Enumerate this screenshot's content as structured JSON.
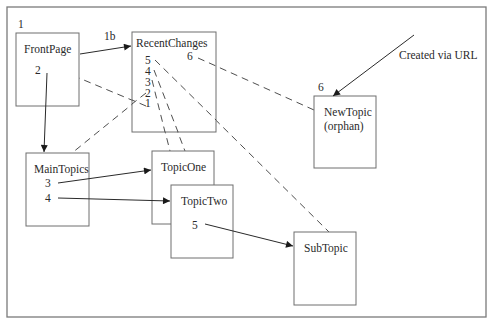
{
  "diagram": {
    "type": "wiki-link-graph",
    "nodes": [
      {
        "id": "frontpage",
        "label": "FrontPage",
        "step": "1",
        "links": [
          "2"
        ]
      },
      {
        "id": "recentchanges",
        "label": "RecentChanges",
        "step": "1b",
        "links": [
          "5",
          "4",
          "3",
          "2",
          "1",
          "6"
        ]
      },
      {
        "id": "newtopic",
        "label": "NewTopic",
        "sublabel": "(orphan)",
        "step": "6"
      },
      {
        "id": "maintopics",
        "label": "MainTopics",
        "links": [
          "3",
          "4"
        ]
      },
      {
        "id": "topicone",
        "label": "TopicOne"
      },
      {
        "id": "topictwo",
        "label": "TopicTwo",
        "links": [
          "5"
        ]
      },
      {
        "id": "subtopic",
        "label": "SubTopic"
      }
    ],
    "edges": [
      {
        "from": "frontpage",
        "to": "recentchanges",
        "label": "1b",
        "style": "solid-arrow"
      },
      {
        "from": "frontpage",
        "to": "maintopics",
        "label": "2",
        "style": "solid-arrow"
      },
      {
        "from": "maintopics",
        "to": "topicone",
        "label": "3",
        "style": "solid-arrow"
      },
      {
        "from": "maintopics",
        "to": "topictwo",
        "label": "4",
        "style": "solid-arrow"
      },
      {
        "from": "topictwo",
        "to": "subtopic",
        "label": "5",
        "style": "solid-arrow"
      },
      {
        "from": "external",
        "to": "newtopic",
        "label": "Created via URL",
        "style": "solid-arrow"
      },
      {
        "from": "recentchanges",
        "to": "frontpage",
        "label": "1",
        "style": "dashed"
      },
      {
        "from": "recentchanges",
        "to": "maintopics",
        "label": "2",
        "style": "dashed"
      },
      {
        "from": "recentchanges",
        "to": "topicone",
        "label": "3",
        "style": "dashed"
      },
      {
        "from": "recentchanges",
        "to": "topictwo",
        "label": "4",
        "style": "dashed"
      },
      {
        "from": "recentchanges",
        "to": "subtopic",
        "label": "5",
        "style": "dashed"
      },
      {
        "from": "recentchanges",
        "to": "newtopic",
        "label": "6",
        "style": "dashed"
      }
    ]
  },
  "labels": {
    "step_1": "1",
    "step_1b": "1b",
    "step_6": "6",
    "frontpage": "FrontPage",
    "frontpage_link_2": "2",
    "recentchanges": "RecentChanges",
    "rc_5": "5",
    "rc_4": "4",
    "rc_3": "3",
    "rc_2": "2",
    "rc_1": "1",
    "rc_6": "6",
    "newtopic": "NewTopic",
    "newtopic_sub": "(orphan)",
    "created_via_url": "Created via URL",
    "maintopics": "MainTopics",
    "mt_3": "3",
    "mt_4": "4",
    "topicone": "TopicOne",
    "topictwo": "TopicTwo",
    "tt_5": "5",
    "subtopic": "SubTopic"
  }
}
